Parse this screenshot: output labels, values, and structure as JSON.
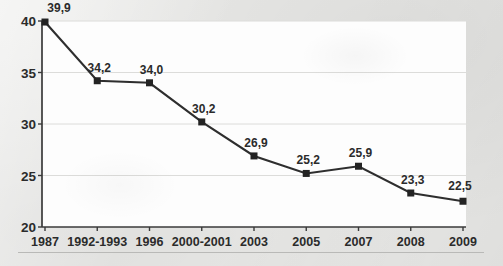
{
  "chart_data": {
    "type": "line",
    "title": "",
    "subtitle": "",
    "xlabel": "",
    "ylabel": "",
    "categories": [
      "1987",
      "1992-1993",
      "1996",
      "2000-2001",
      "2003",
      "2005",
      "2007",
      "2008",
      "2009"
    ],
    "values": [
      39.9,
      34.2,
      34.0,
      30.2,
      26.9,
      25.2,
      25.9,
      23.3,
      22.5
    ],
    "point_labels": [
      "39,9",
      "34,2",
      "34,0",
      "30,2",
      "26,9",
      "25,2",
      "25,9",
      "23,3",
      "22,5"
    ],
    "ylim": [
      20,
      40
    ],
    "yticks": [
      20,
      25,
      30,
      35,
      40
    ],
    "ytick_labels": [
      "20",
      "25",
      "30",
      "35",
      "40"
    ],
    "grid": true,
    "legend": false,
    "legend_position": "none",
    "decimal_separator": ",",
    "series": [
      {
        "name": "",
        "values": [
          39.9,
          34.2,
          34.0,
          30.2,
          26.9,
          25.2,
          25.9,
          23.3,
          22.5
        ],
        "marker": "square",
        "color": "#232323"
      }
    ],
    "colors": {
      "line": "#2e2e2e",
      "marker": "#232323",
      "gridline": "#dcdcda",
      "axis": "#3a3a3a",
      "plot_background": "#fdfdfd",
      "page_background": "#e9e9e7",
      "text": "#2b2b2b"
    }
  }
}
